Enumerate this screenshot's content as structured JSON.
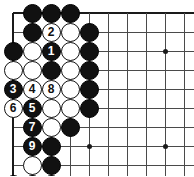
{
  "figure": {
    "kind": "go-board-diagram",
    "width": 194,
    "height": 176,
    "colors": {
      "background": "#ffffff",
      "grid_line": "#4a4a4a",
      "board_edge": "#1a1a1a",
      "black_stone": "#111111",
      "white_stone": "#ffffff",
      "black_label": "#ffffff",
      "white_label": "#111111"
    }
  },
  "board": {
    "origin_x": 13,
    "origin_y": 13,
    "spacing": 19,
    "cols": 10,
    "rows": 9,
    "edges": {
      "top": true,
      "left": true,
      "right": false,
      "bottom": false
    },
    "star_points": [
      {
        "col": 8,
        "row": 2
      },
      {
        "col": 8,
        "row": 7
      },
      {
        "col": 4,
        "row": 7
      }
    ]
  },
  "stones": [
    {
      "col": 1,
      "row": 0,
      "color": "black",
      "label": ""
    },
    {
      "col": 2,
      "row": 0,
      "color": "black",
      "label": ""
    },
    {
      "col": 3,
      "row": 0,
      "color": "black",
      "label": ""
    },
    {
      "col": 1,
      "row": 1,
      "color": "black",
      "label": ""
    },
    {
      "col": 2,
      "row": 1,
      "color": "white",
      "label": "2"
    },
    {
      "col": 3,
      "row": 1,
      "color": "white",
      "label": ""
    },
    {
      "col": 4,
      "row": 1,
      "color": "black",
      "label": ""
    },
    {
      "col": 0,
      "row": 2,
      "color": "black",
      "label": ""
    },
    {
      "col": 1,
      "row": 2,
      "color": "white",
      "label": ""
    },
    {
      "col": 2,
      "row": 2,
      "color": "black",
      "label": "1"
    },
    {
      "col": 3,
      "row": 2,
      "color": "white",
      "label": ""
    },
    {
      "col": 4,
      "row": 2,
      "color": "black",
      "label": ""
    },
    {
      "col": 0,
      "row": 3,
      "color": "white",
      "label": ""
    },
    {
      "col": 1,
      "row": 3,
      "color": "white",
      "label": ""
    },
    {
      "col": 2,
      "row": 3,
      "color": "black",
      "label": ""
    },
    {
      "col": 3,
      "row": 3,
      "color": "white",
      "label": ""
    },
    {
      "col": 4,
      "row": 3,
      "color": "black",
      "label": ""
    },
    {
      "col": 0,
      "row": 4,
      "color": "black",
      "label": "3"
    },
    {
      "col": 1,
      "row": 4,
      "color": "white",
      "label": "4"
    },
    {
      "col": 2,
      "row": 4,
      "color": "white",
      "label": "8"
    },
    {
      "col": 3,
      "row": 4,
      "color": "white",
      "label": ""
    },
    {
      "col": 4,
      "row": 4,
      "color": "black",
      "label": ""
    },
    {
      "col": 0,
      "row": 5,
      "color": "white",
      "label": "6"
    },
    {
      "col": 1,
      "row": 5,
      "color": "black",
      "label": "5"
    },
    {
      "col": 2,
      "row": 5,
      "color": "white",
      "label": ""
    },
    {
      "col": 3,
      "row": 5,
      "color": "white",
      "label": ""
    },
    {
      "col": 4,
      "row": 5,
      "color": "black",
      "label": ""
    },
    {
      "col": 1,
      "row": 6,
      "color": "black",
      "label": "7"
    },
    {
      "col": 2,
      "row": 6,
      "color": "white",
      "label": ""
    },
    {
      "col": 3,
      "row": 6,
      "color": "black",
      "label": ""
    },
    {
      "col": 1,
      "row": 7,
      "color": "black",
      "label": "9"
    },
    {
      "col": 2,
      "row": 7,
      "color": "black",
      "label": ""
    },
    {
      "col": 1,
      "row": 8,
      "color": "white",
      "label": ""
    },
    {
      "col": 2,
      "row": 8,
      "color": "black",
      "label": ""
    },
    {
      "col": 0,
      "row": 9,
      "color": "black",
      "label": ""
    },
    {
      "col": 1,
      "row": 9,
      "color": "black",
      "label": ""
    },
    {
      "col": 2,
      "row": 9,
      "color": "black",
      "label": ""
    }
  ],
  "move_sequence": [
    {
      "number": "1",
      "color": "black"
    },
    {
      "number": "2",
      "color": "white"
    },
    {
      "number": "3",
      "color": "black"
    },
    {
      "number": "4",
      "color": "white"
    },
    {
      "number": "5",
      "color": "black"
    },
    {
      "number": "6",
      "color": "white"
    },
    {
      "number": "7",
      "color": "black"
    },
    {
      "number": "8",
      "color": "white"
    },
    {
      "number": "9",
      "color": "black"
    }
  ]
}
